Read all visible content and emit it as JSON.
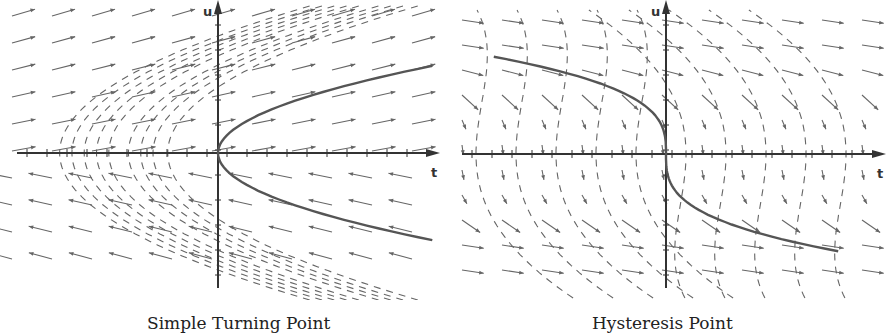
{
  "figure": {
    "panels": [
      {
        "id": "left",
        "caption": "Simple Turning Point",
        "x_axis_label": "t",
        "y_axis_label": "u",
        "description": "Direction field with a parabolic curve opening to the right (u^2 = t); flow arrows point right in the upper half and left in the lower half; dashed integral curves are parabolas opening right."
      },
      {
        "id": "right",
        "caption": "Hysteresis Point",
        "x_axis_label": "t",
        "y_axis_label": "u",
        "description": "Direction field with a cubic curve (u^3 = -t) passing through origin with vertical tangent; arrows point right/down; dashed integral curves bend downward."
      }
    ],
    "colors": {
      "axis": "#333333",
      "curve": "#555555",
      "field": "#666666",
      "caption": "#222222"
    }
  }
}
